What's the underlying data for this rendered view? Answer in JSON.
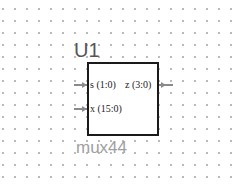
{
  "component": {
    "ref_designator": "U1",
    "cell_name": "mux44",
    "pins": [
      {
        "name": "s (1:0)",
        "side": "left",
        "direction": "input"
      },
      {
        "name": "x (15:0)",
        "side": "left",
        "direction": "input"
      },
      {
        "name": "z (3:0)",
        "side": "right",
        "direction": "output"
      }
    ]
  },
  "colors": {
    "border": "#1a1a1a",
    "pin": "#8a8a8a",
    "grid_dot": "#b8b8b8",
    "ref_text": "#555555",
    "cell_text": "#a0a0a0"
  }
}
